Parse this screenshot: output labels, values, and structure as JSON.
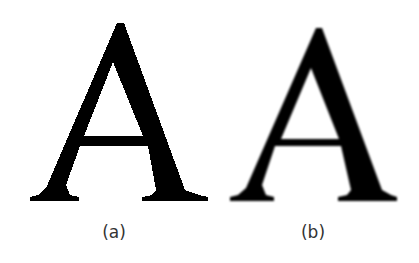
{
  "figure": {
    "panels": [
      {
        "letter": "A",
        "label": "(a)",
        "rendering": "aliased"
      },
      {
        "letter": "A",
        "label": "(b)",
        "rendering": "anti-aliased"
      }
    ],
    "colors": {
      "glyph": "#000000",
      "background": "#ffffff",
      "label": "#333333"
    }
  }
}
